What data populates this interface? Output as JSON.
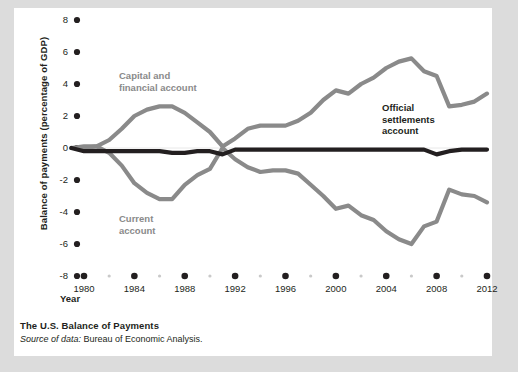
{
  "figure": {
    "caption_title": "The U.S. Balance of Payments",
    "caption_source_label": "Source of data:",
    "caption_source_value": " Bureau of Economic Analysis."
  },
  "colors": {
    "gray_series": "#8a8a8a",
    "black_series": "#231f20",
    "card_background": "#ffffff",
    "page_background": "#dcdcdc",
    "tick_dot": "#231f20",
    "minor_tick_dot": "#c9c9c9"
  },
  "chart_data": {
    "type": "line",
    "title": "The U.S. Balance of Payments",
    "xlabel": "Year",
    "ylabel": "Balance of payments (percentage of GDP)",
    "xlim": [
      1979,
      2013
    ],
    "ylim": [
      -8,
      8
    ],
    "xticks": [
      1980,
      1984,
      1988,
      1992,
      1996,
      2000,
      2004,
      2008,
      2012
    ],
    "xticklabels": [
      "1980",
      "1984",
      "1988",
      "1992",
      "1996",
      "2000",
      "2004",
      "2008",
      "2012"
    ],
    "minor_xticks": [
      1982,
      1986,
      1990,
      1994,
      1998,
      2002,
      2006,
      2010
    ],
    "yticks": [
      8,
      6,
      4,
      2,
      0,
      -2,
      -4,
      -6,
      -8
    ],
    "yticklabels": [
      "8",
      "6",
      "4",
      "2",
      "0",
      "-2",
      "-4",
      "-6",
      "-8"
    ],
    "grid": false,
    "legend": "inline-labels",
    "x": [
      1979,
      1980,
      1981,
      1982,
      1983,
      1984,
      1985,
      1986,
      1987,
      1988,
      1989,
      1990,
      1991,
      1992,
      1993,
      1994,
      1995,
      1996,
      1997,
      1998,
      1999,
      2000,
      2001,
      2002,
      2003,
      2004,
      2005,
      2006,
      2007,
      2008,
      2009,
      2010,
      2011,
      2012
    ],
    "series": [
      {
        "name": "Capital and financial account",
        "label": "Capital and\nfinancial account",
        "color": "#8a8a8a",
        "values": [
          0.0,
          0.0,
          0.1,
          0.5,
          1.2,
          2.0,
          2.4,
          2.6,
          2.6,
          2.2,
          1.6,
          1.0,
          0.1,
          0.6,
          1.2,
          1.4,
          1.4,
          1.4,
          1.7,
          2.2,
          3.0,
          3.6,
          3.4,
          4.0,
          4.4,
          5.0,
          5.4,
          5.6,
          4.8,
          4.5,
          2.6,
          2.7,
          2.9,
          3.4
        ]
      },
      {
        "name": "Current account",
        "label": "Current\naccount",
        "color": "#8a8a8a",
        "values": [
          0.0,
          0.1,
          0.1,
          -0.3,
          -1.1,
          -2.2,
          -2.8,
          -3.2,
          -3.2,
          -2.3,
          -1.7,
          -1.3,
          0.0,
          -0.7,
          -1.2,
          -1.5,
          -1.4,
          -1.4,
          -1.6,
          -2.3,
          -3.0,
          -3.8,
          -3.6,
          -4.2,
          -4.5,
          -5.2,
          -5.7,
          -6.0,
          -4.9,
          -4.6,
          -2.6,
          -2.9,
          -3.0,
          -3.4
        ]
      },
      {
        "name": "Official settlements account",
        "label": "Official\nsettlements\naccount",
        "color": "#231f20",
        "values": [
          0.0,
          -0.2,
          -0.2,
          -0.2,
          -0.2,
          -0.2,
          -0.2,
          -0.2,
          -0.3,
          -0.3,
          -0.2,
          -0.2,
          -0.4,
          -0.1,
          -0.1,
          -0.1,
          -0.1,
          -0.1,
          -0.1,
          -0.1,
          -0.1,
          -0.1,
          -0.1,
          -0.1,
          -0.1,
          -0.1,
          -0.1,
          -0.1,
          -0.1,
          -0.4,
          -0.2,
          -0.1,
          -0.1,
          -0.1
        ]
      }
    ]
  }
}
